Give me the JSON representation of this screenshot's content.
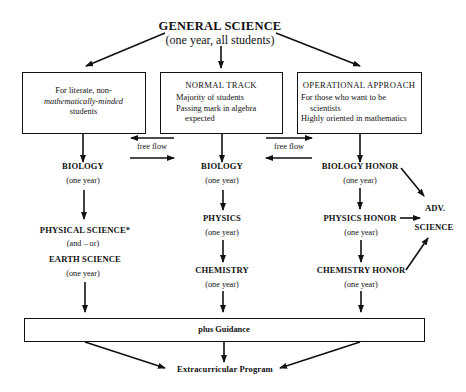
{
  "header": {
    "title": "GENERAL SCIENCE",
    "subtitle": "(one year, all students)"
  },
  "tracks": [
    {
      "id": "left",
      "box_lines": [
        "For literate, non-",
        "mathematically-minded",
        "students"
      ],
      "courses": [
        {
          "name": "BIOLOGY",
          "duration": "(one year)"
        },
        {
          "name": "PHYSICAL SCIENCE*",
          "connector": "(and – or)"
        },
        {
          "name": "EARTH SCIENCE",
          "duration": "(one year)"
        }
      ]
    },
    {
      "id": "middle",
      "box_title": "NORMAL TRACK",
      "box_lines": [
        "Majority of students",
        "Passing mark in algebra",
        "expected"
      ],
      "courses": [
        {
          "name": "BIOLOGY",
          "duration": "(one year)"
        },
        {
          "name": "PHYSICS",
          "duration": "(one year)"
        },
        {
          "name": "CHEMISTRY",
          "duration": "(one year)"
        }
      ]
    },
    {
      "id": "right",
      "box_title": "OPERATIONAL APPROACH",
      "box_lines": [
        "For those who want to be",
        "scientists",
        "Highly oriented in mathematics"
      ],
      "courses": [
        {
          "name": "BIOLOGY HONOR",
          "duration": "(one year)"
        },
        {
          "name": "PHYSICS HONOR",
          "duration": "(one year)"
        },
        {
          "name": "CHEMISTRY HONOR",
          "duration": "(one year)"
        }
      ]
    }
  ],
  "free_flow": {
    "left_label": "free flow",
    "right_label": "free flow"
  },
  "advanced": {
    "line1": "ADV.",
    "line2": "SCIENCE"
  },
  "guidance": {
    "label": "plus Guidance"
  },
  "extracurricular": {
    "label": "Extracurricular Program"
  }
}
